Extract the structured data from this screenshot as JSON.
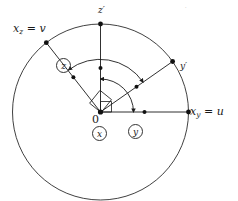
{
  "figure": {
    "type": "geometry-diagram",
    "background_color": "#ffffff",
    "stroke_color": "#1a1a1a",
    "circle": {
      "cx": 100.5,
      "cy": 112,
      "r": 88
    },
    "origin_label": "0",
    "labels": {
      "axis_xz": {
        "base": "x",
        "sub": "z",
        "eq": " = ",
        "value": "v",
        "full": "x_z = v"
      },
      "axis_xy": {
        "base": "x",
        "sub": "y",
        "eq": " = ",
        "value": "u",
        "full": "x_y = u"
      },
      "axis_zp": {
        "full": "z′"
      },
      "axis_yp": {
        "full": "y′"
      },
      "origin": {
        "full": "0"
      },
      "speck": {
        "full": "·"
      }
    },
    "circled_labels": [
      {
        "name": "circled-z",
        "text": "z",
        "x": 63,
        "y": 65
      },
      {
        "name": "circled-x",
        "text": "x",
        "x": 99,
        "y": 133
      },
      {
        "name": "circled-y",
        "text": "y",
        "x": 135,
        "y": 131
      }
    ],
    "radii": [
      {
        "name": "radius-zprime",
        "angle_deg": 90,
        "endpoint_label": "z′",
        "has_endpoint_dot": true,
        "has_midpoint_dot": true
      },
      {
        "name": "radius-yprime",
        "angle_deg": 35,
        "endpoint_label": "y′",
        "has_endpoint_dot": true,
        "has_midpoint_dot": true
      },
      {
        "name": "radius-xy",
        "angle_deg": 0,
        "endpoint_label": "x_y = u",
        "has_endpoint_dot": true,
        "has_midpoint_dot": true
      },
      {
        "name": "radius-xz",
        "angle_deg": 128,
        "endpoint_label": "x_z = v",
        "has_endpoint_dot": true,
        "has_midpoint_dot": true
      }
    ],
    "arcs": [
      {
        "name": "arc-outer",
        "radius": 52,
        "start_deg": 35,
        "end_deg": 128,
        "arrow_at": "both"
      },
      {
        "name": "arc-inner",
        "radius": 33,
        "start_deg": 0,
        "end_deg": 90,
        "arrow_at": "both"
      }
    ],
    "right_angle_marker": {
      "name": "right-angle-square",
      "at_origin": true,
      "size": 14
    }
  }
}
